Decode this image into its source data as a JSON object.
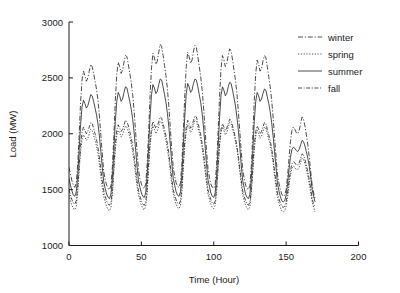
{
  "chart_data": {
    "type": "line",
    "title": "",
    "xlabel": "Time (Hour)",
    "ylabel": "Load (MW)",
    "xlim": [
      0,
      200
    ],
    "ylim": [
      1000,
      3000
    ],
    "xticks": [
      0,
      50,
      100,
      150,
      200
    ],
    "yticks": [
      1000,
      1500,
      2000,
      2500,
      3000
    ],
    "grid": false,
    "legend_position": "top-right",
    "x": [
      0,
      1,
      2,
      3,
      4,
      5,
      6,
      7,
      8,
      9,
      10,
      11,
      12,
      13,
      14,
      15,
      16,
      17,
      18,
      19,
      20,
      21,
      22,
      23,
      24,
      25,
      26,
      27,
      28,
      29,
      30,
      31,
      32,
      33,
      34,
      35,
      36,
      37,
      38,
      39,
      40,
      41,
      42,
      43,
      44,
      45,
      46,
      47,
      48,
      49,
      50,
      51,
      52,
      53,
      54,
      55,
      56,
      57,
      58,
      59,
      60,
      61,
      62,
      63,
      64,
      65,
      66,
      67,
      68,
      69,
      70,
      71,
      72,
      73,
      74,
      75,
      76,
      77,
      78,
      79,
      80,
      81,
      82,
      83,
      84,
      85,
      86,
      87,
      88,
      89,
      90,
      91,
      92,
      93,
      94,
      95,
      96,
      97,
      98,
      99,
      100,
      101,
      102,
      103,
      104,
      105,
      106,
      107,
      108,
      109,
      110,
      111,
      112,
      113,
      114,
      115,
      116,
      117,
      118,
      119,
      120,
      121,
      122,
      123,
      124,
      125,
      126,
      127,
      128,
      129,
      130,
      131,
      132,
      133,
      134,
      135,
      136,
      137,
      138,
      139,
      140,
      141,
      142,
      143,
      144,
      145,
      146,
      147,
      148,
      149,
      150,
      151,
      152,
      153,
      154,
      155,
      156,
      157,
      158,
      159,
      160,
      161,
      162,
      163,
      164,
      165,
      166,
      167,
      168,
      169,
      170
    ],
    "series": [
      {
        "name": "winter",
        "style": "dashdot",
        "values": [
          1700,
          1640,
          1580,
          1540,
          1520,
          1560,
          1720,
          1980,
          2280,
          2480,
          2560,
          2520,
          2470,
          2500,
          2560,
          2620,
          2600,
          2540,
          2470,
          2400,
          2300,
          2160,
          1990,
          1820,
          1660,
          1590,
          1540,
          1510,
          1500,
          1540,
          1710,
          1980,
          2300,
          2530,
          2640,
          2600,
          2540,
          2570,
          2640,
          2700,
          2690,
          2620,
          2540,
          2460,
          2350,
          2200,
          2020,
          1840,
          1680,
          1600,
          1550,
          1520,
          1510,
          1550,
          1730,
          2010,
          2340,
          2590,
          2720,
          2680,
          2620,
          2650,
          2730,
          2800,
          2780,
          2700,
          2610,
          2520,
          2400,
          2240,
          2050,
          1860,
          1700,
          1620,
          1560,
          1530,
          1520,
          1560,
          1740,
          2020,
          2350,
          2600,
          2730,
          2690,
          2630,
          2660,
          2740,
          2790,
          2770,
          2690,
          2600,
          2510,
          2390,
          2230,
          2040,
          1850,
          1690,
          1610,
          1550,
          1520,
          1510,
          1550,
          1730,
          2010,
          2330,
          2580,
          2700,
          2660,
          2600,
          2630,
          2700,
          2760,
          2740,
          2660,
          2570,
          2480,
          2360,
          2200,
          2020,
          1840,
          1680,
          1600,
          1540,
          1510,
          1500,
          1540,
          1720,
          1990,
          2300,
          2540,
          2660,
          2620,
          2560,
          2580,
          2650,
          2700,
          2680,
          2600,
          2510,
          2420,
          2300,
          2150,
          1970,
          1800,
          1640,
          1560,
          1500,
          1460,
          1440,
          1450,
          1500,
          1620,
          1780,
          1930,
          2030,
          2060,
          2040,
          2010,
          2000,
          2030,
          2090,
          2150,
          2130,
          2070,
          1990,
          1900,
          1790,
          1660,
          1540,
          1470,
          1420
        ]
      },
      {
        "name": "spring",
        "style": "dotted",
        "values": [
          1450,
          1400,
          1360,
          1330,
          1320,
          1350,
          1470,
          1660,
          1840,
          1950,
          1990,
          1970,
          1940,
          1960,
          2000,
          2040,
          2030,
          1990,
          1940,
          1890,
          1820,
          1730,
          1620,
          1520,
          1440,
          1390,
          1350,
          1320,
          1310,
          1340,
          1460,
          1660,
          1860,
          1980,
          2030,
          2010,
          1970,
          1990,
          2030,
          2070,
          2060,
          2020,
          1970,
          1910,
          1840,
          1750,
          1640,
          1530,
          1450,
          1400,
          1360,
          1330,
          1320,
          1350,
          1470,
          1680,
          1890,
          2010,
          2070,
          2040,
          2000,
          2020,
          2070,
          2110,
          2100,
          2050,
          2000,
          1940,
          1860,
          1770,
          1660,
          1550,
          1460,
          1410,
          1370,
          1340,
          1330,
          1360,
          1480,
          1690,
          1900,
          2020,
          2080,
          2050,
          2010,
          2030,
          2080,
          2120,
          2110,
          2060,
          2010,
          1950,
          1870,
          1780,
          1670,
          1560,
          1460,
          1410,
          1370,
          1340,
          1330,
          1360,
          1480,
          1680,
          1890,
          2010,
          2060,
          2030,
          1990,
          2010,
          2060,
          2100,
          2090,
          2040,
          1990,
          1930,
          1860,
          1770,
          1660,
          1550,
          1450,
          1400,
          1360,
          1330,
          1320,
          1350,
          1470,
          1660,
          1860,
          1980,
          2030,
          2000,
          1960,
          1980,
          2020,
          2060,
          2050,
          2000,
          1950,
          1900,
          1830,
          1740,
          1630,
          1530,
          1430,
          1380,
          1340,
          1310,
          1300,
          1310,
          1350,
          1430,
          1540,
          1630,
          1690,
          1710,
          1700,
          1680,
          1680,
          1700,
          1740,
          1780,
          1770,
          1730,
          1680,
          1620,
          1550,
          1470,
          1390,
          1340,
          1300
        ]
      },
      {
        "name": "summer",
        "style": "solid",
        "values": [
          1600,
          1540,
          1490,
          1450,
          1440,
          1480,
          1620,
          1850,
          2080,
          2240,
          2300,
          2270,
          2230,
          2250,
          2300,
          2350,
          2340,
          2290,
          2230,
          2170,
          2090,
          1980,
          1840,
          1700,
          1570,
          1510,
          1460,
          1430,
          1420,
          1460,
          1610,
          1850,
          2110,
          2290,
          2370,
          2340,
          2290,
          2310,
          2370,
          2420,
          2410,
          2350,
          2290,
          2220,
          2130,
          2010,
          1860,
          1710,
          1580,
          1520,
          1470,
          1440,
          1430,
          1470,
          1630,
          1880,
          2150,
          2350,
          2440,
          2410,
          2360,
          2380,
          2440,
          2490,
          2480,
          2420,
          2350,
          2280,
          2180,
          2060,
          1900,
          1740,
          1600,
          1540,
          1480,
          1450,
          1440,
          1480,
          1640,
          1890,
          2160,
          2360,
          2450,
          2420,
          2370,
          2390,
          2450,
          2490,
          2480,
          2420,
          2350,
          2280,
          2180,
          2050,
          1890,
          1730,
          1590,
          1530,
          1470,
          1440,
          1430,
          1470,
          1630,
          1870,
          2140,
          2340,
          2420,
          2390,
          2340,
          2360,
          2420,
          2460,
          2450,
          2390,
          2320,
          2250,
          2150,
          2030,
          1880,
          1720,
          1580,
          1520,
          1460,
          1430,
          1420,
          1460,
          1610,
          1850,
          2110,
          2290,
          2370,
          2340,
          2290,
          2310,
          2360,
          2400,
          2390,
          2330,
          2270,
          2200,
          2100,
          1980,
          1840,
          1700,
          1560,
          1490,
          1440,
          1400,
          1390,
          1400,
          1450,
          1550,
          1680,
          1790,
          1860,
          1880,
          1870,
          1850,
          1840,
          1860,
          1900,
          1940,
          1930,
          1890,
          1840,
          1780,
          1710,
          1610,
          1500,
          1440,
          1390
        ]
      },
      {
        "name": "fall",
        "style": "dashdot2",
        "values": [
          1500,
          1450,
          1410,
          1380,
          1370,
          1400,
          1520,
          1710,
          1900,
          2010,
          2060,
          2030,
          2000,
          2020,
          2060,
          2100,
          2090,
          2050,
          2000,
          1950,
          1880,
          1790,
          1680,
          1580,
          1490,
          1440,
          1400,
          1370,
          1360,
          1390,
          1510,
          1710,
          1910,
          2030,
          2080,
          2050,
          2020,
          2040,
          2080,
          2120,
          2110,
          2070,
          2020,
          1960,
          1890,
          1800,
          1690,
          1580,
          1490,
          1440,
          1400,
          1370,
          1360,
          1390,
          1520,
          1730,
          1930,
          2050,
          2110,
          2080,
          2050,
          2070,
          2110,
          2150,
          2140,
          2090,
          2040,
          1980,
          1910,
          1820,
          1710,
          1600,
          1500,
          1450,
          1410,
          1380,
          1370,
          1400,
          1530,
          1740,
          1940,
          2060,
          2120,
          2090,
          2050,
          2070,
          2120,
          2160,
          2150,
          2100,
          2050,
          1990,
          1910,
          1820,
          1710,
          1600,
          1500,
          1450,
          1410,
          1380,
          1370,
          1400,
          1520,
          1720,
          1920,
          2040,
          2090,
          2060,
          2030,
          2050,
          2090,
          2130,
          2120,
          2070,
          2020,
          1960,
          1890,
          1800,
          1690,
          1590,
          1490,
          1440,
          1400,
          1370,
          1360,
          1390,
          1510,
          1700,
          1900,
          2020,
          2070,
          2040,
          2000,
          2020,
          2060,
          2100,
          2090,
          2040,
          1990,
          1940,
          1870,
          1780,
          1670,
          1570,
          1470,
          1420,
          1380,
          1350,
          1340,
          1350,
          1390,
          1470,
          1580,
          1670,
          1730,
          1750,
          1740,
          1720,
          1720,
          1740,
          1780,
          1820,
          1810,
          1770,
          1720,
          1660,
          1590,
          1510,
          1420,
          1370,
          1340
        ]
      }
    ]
  },
  "legend": {
    "items": [
      {
        "label": "winter"
      },
      {
        "label": "spring"
      },
      {
        "label": "summer"
      },
      {
        "label": "fall"
      }
    ]
  }
}
